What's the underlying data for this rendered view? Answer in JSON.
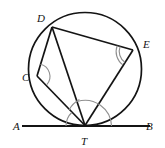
{
  "figure": {
    "kind": "circle-geometry-diagram",
    "background_color": "#ffffff",
    "stroke_color": "#141414",
    "arc_color": "#8c8c8c",
    "canvas": {
      "width": 165,
      "height": 148
    },
    "circle": {
      "cx": 85,
      "cy": 69,
      "r": 56.5
    },
    "points": [
      {
        "id": "A",
        "label": "A",
        "x": 22,
        "y": 126,
        "label_x": 13,
        "label_y": 130,
        "on_circle": false
      },
      {
        "id": "B",
        "label": "B",
        "x": 150,
        "y": 126,
        "label_x": 146,
        "label_y": 130,
        "on_circle": false
      },
      {
        "id": "C",
        "label": "C",
        "x": 37,
        "y": 76,
        "label_x": 27,
        "label_y": 81,
        "on_circle": true
      },
      {
        "id": "D",
        "label": "D",
        "x": 52,
        "y": 27,
        "label_x": 40,
        "label_y": 22,
        "on_circle": true
      },
      {
        "id": "E",
        "label": "E",
        "x": 133,
        "y": 50,
        "label_x": 143,
        "label_y": 48,
        "on_circle": true
      },
      {
        "id": "T",
        "label": "T",
        "x": 85,
        "y": 125.5,
        "label_x": 82,
        "label_y": 145,
        "on_circle": true
      }
    ],
    "tangent_line": {
      "from": "A",
      "to": "B",
      "touches_at": "T"
    },
    "chords": [
      {
        "from": "D",
        "to": "E"
      },
      {
        "from": "D",
        "to": "C"
      },
      {
        "from": "D",
        "to": "T"
      },
      {
        "from": "C",
        "to": "T"
      },
      {
        "from": "E",
        "to": "T"
      }
    ],
    "angle_marks": [
      {
        "id": "angle-at-c",
        "vertex": "C",
        "rays": [
          "D",
          "T"
        ],
        "arcs": 1
      },
      {
        "id": "angle-at-e",
        "vertex": "E",
        "rays": [
          "D",
          "T"
        ],
        "arcs": 2
      },
      {
        "id": "angle-at-t-left",
        "vertex": "T",
        "rays": [
          "A",
          "C"
        ],
        "arcs": 1
      },
      {
        "id": "angle-at-t-ctd",
        "vertex": "T",
        "rays": [
          "C",
          "D"
        ],
        "arcs": 1
      },
      {
        "id": "angle-at-t-right",
        "vertex": "T",
        "rays": [
          "D",
          "B"
        ],
        "arcs": 1
      }
    ]
  }
}
